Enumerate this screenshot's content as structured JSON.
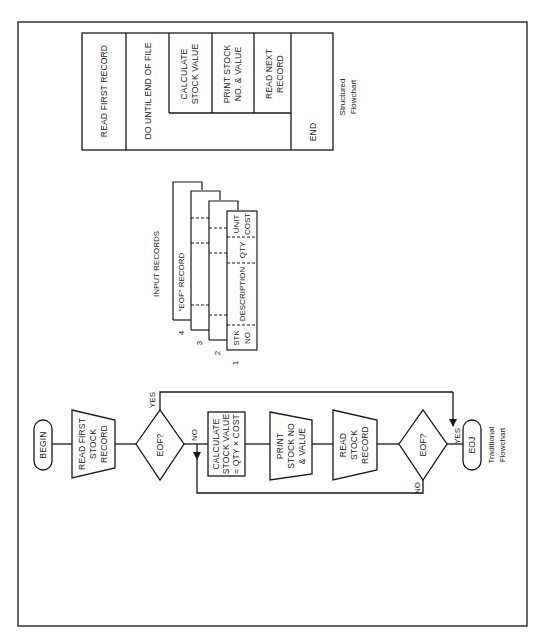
{
  "structured_flowchart": {
    "caption": [
      "Structured",
      "Flowchart"
    ],
    "read_first": "READ FIRST RECORD",
    "do_until": "DO UNTIL END OF FILE",
    "calculate": [
      "CALCULATE",
      "STOCK VALUE"
    ],
    "print": [
      "PRINT STOCK",
      "NO. & VALUE"
    ],
    "read_next": [
      "READ NEXT",
      "RECORD"
    ],
    "end": "END"
  },
  "input_records": {
    "title": "INPUT RECORDS",
    "eof_record": "“EOF” RECORD",
    "card_numbers": [
      "1",
      "2",
      "3",
      "4"
    ],
    "fields": [
      [
        "STK",
        "NO"
      ],
      [
        "DESCRIPTION"
      ],
      [
        "QTY"
      ],
      [
        "UNIT",
        "COST"
      ]
    ]
  },
  "traditional_flowchart": {
    "caption": [
      "Traditional",
      "Flowchart"
    ],
    "begin": "BEGIN",
    "read_first": [
      "READ FIRST",
      "STOCK",
      "RECORD"
    ],
    "eof1": "EOF?",
    "yes1": "YES",
    "no1": "NO",
    "calculate": [
      "CALCULATE",
      "STOCK VALUE",
      "= QTY × COST"
    ],
    "print": [
      "PRINT",
      "STOCK NO",
      "& VALUE"
    ],
    "read": [
      "READ",
      "STOCK",
      "RECORD"
    ],
    "eof2": "EOF?",
    "yes2": "YES",
    "no2": "NO",
    "eoj": "EOJ"
  }
}
